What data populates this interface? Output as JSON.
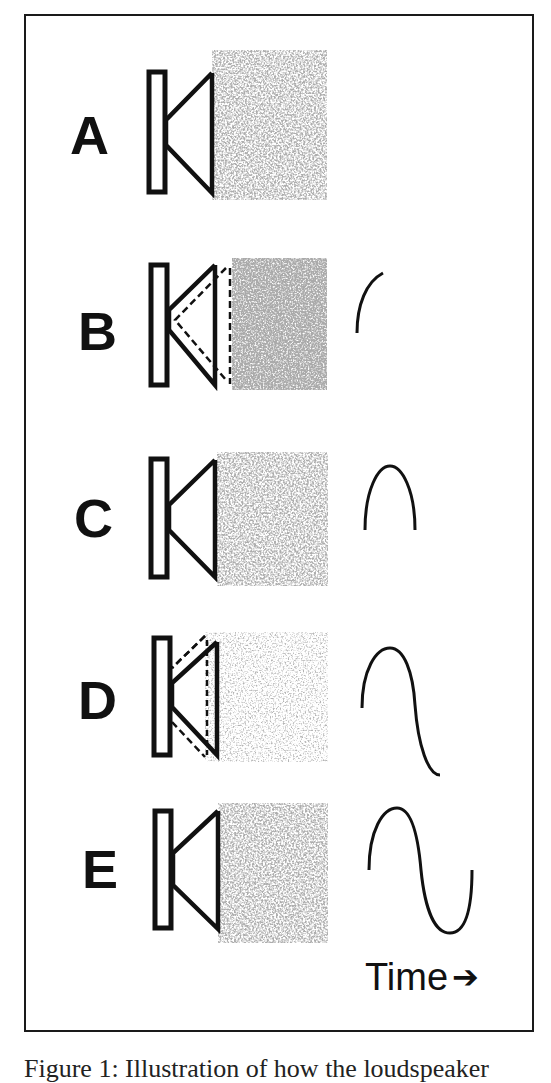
{
  "figure": {
    "rows": [
      {
        "label": "A",
        "state": "rest",
        "waveform": "none"
      },
      {
        "label": "B",
        "state": "compression",
        "waveform": "quarter-cycle"
      },
      {
        "label": "C",
        "state": "rest",
        "waveform": "half-cycle"
      },
      {
        "label": "D",
        "state": "rarefaction",
        "waveform": "three-quarter-cycle"
      },
      {
        "label": "E",
        "state": "rest",
        "waveform": "full-cycle"
      }
    ],
    "axis_label": "Time",
    "axis_arrow": "➔",
    "caption": "Figure 1: Illustration of how the loudspeaker"
  },
  "colors": {
    "stroke": "#111111",
    "noise": "#7a7a7a",
    "background": "#ffffff"
  }
}
